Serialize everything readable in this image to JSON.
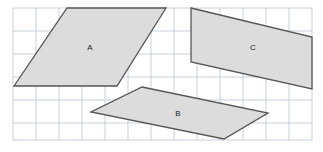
{
  "figure": {
    "width": 323,
    "height": 152,
    "background_color": "#ffffff",
    "grid": {
      "name": "square-grid",
      "left": 13,
      "top": 8,
      "right": 312,
      "bottom": 140,
      "cell_size": 23,
      "line_color": "#b9c4d4",
      "line_width": 0.8,
      "x_lines": [
        13,
        36,
        59,
        82,
        105,
        128,
        151,
        174,
        197,
        220,
        243,
        266,
        289,
        312
      ],
      "y_lines": [
        8,
        31,
        54,
        77,
        100,
        123,
        140
      ]
    },
    "style": {
      "fill_color": "#dcdcdc",
      "stroke_color": "#555555",
      "stroke_width": 1.3,
      "label_color": "#1a1a1a",
      "label_font_size": 8
    },
    "shapes": [
      {
        "id": "shape-a",
        "label": "A",
        "label_x": 90,
        "label_y": 48,
        "points": "67,8 166,8 117,86 14,86"
      },
      {
        "id": "shape-b",
        "label": "B",
        "label_x": 178,
        "label_y": 114,
        "points": "142,87 268,113 224,139 91,112"
      },
      {
        "id": "shape-c",
        "label": "C",
        "label_x": 253,
        "label_y": 48,
        "points": "191,8 312,37 312,89 191,62"
      }
    ]
  }
}
